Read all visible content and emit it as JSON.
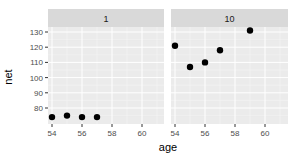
{
  "chart_data": {
    "type": "scatter",
    "title": "",
    "xlabel": "age",
    "ylabel": "net",
    "facets": [
      "1",
      "10"
    ],
    "xlim": [
      53.8,
      61
    ],
    "ylim": [
      71,
      135
    ],
    "x_ticks": [
      54,
      56,
      58,
      60
    ],
    "y_ticks": [
      80,
      90,
      100,
      110,
      120,
      130
    ],
    "grid": true,
    "legend": null,
    "series": [
      {
        "name": "1",
        "points": [
          {
            "x": 54,
            "y": 74
          },
          {
            "x": 55,
            "y": 75
          },
          {
            "x": 56,
            "y": 74
          },
          {
            "x": 57,
            "y": 74
          }
        ]
      },
      {
        "name": "10",
        "points": [
          {
            "x": 54,
            "y": 121
          },
          {
            "x": 55,
            "y": 107
          },
          {
            "x": 56,
            "y": 110
          },
          {
            "x": 57,
            "y": 118
          },
          {
            "x": 59,
            "y": 131
          }
        ]
      }
    ]
  },
  "colors": {
    "panel_bg": "#ebebeb",
    "strip_bg": "#d9d9d9",
    "grid_major": "#ffffff",
    "grid_minor": "#f5f5f5",
    "point": "#000000",
    "axis_text": "#4d4d4d",
    "title_text": "#000000"
  }
}
